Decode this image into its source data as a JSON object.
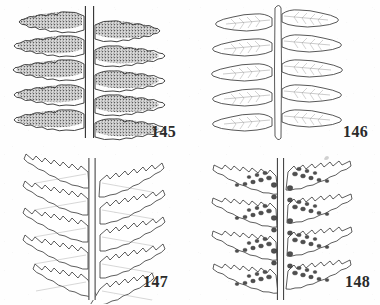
{
  "plate": {
    "background_color": "#fefefe",
    "ink_color": "#2b2b2b",
    "sori_fill_color": "#585858",
    "layout": "2x2 grid of pinnately compound fern frond line drawings, each labelled with a figure number at lower right",
    "medium": "scanned black-and-white botanical line illustration"
  },
  "figures": [
    {
      "number": "145",
      "position": "top-left",
      "pinna_pairs": 5,
      "outline_style": "crenate-scalloped margin",
      "fill": "dense stipple covering almost the entire pinna surface (mature sori)",
      "rachis": "narrow pale vertical band with dark double outline",
      "description": "Frond segment with oblong blunt pinnae almost wholly covered by dense confluent sori"
    },
    {
      "number": "146",
      "position": "top-right",
      "pinna_pairs": 5,
      "outline_style": "finely toothed to entire margin",
      "fill": "open white interior with faint midvein and oblique lateral veins",
      "rachis": "slender pale midrib with fine outline",
      "description": "Sterile frond segment with blunt oblong pinnae, venation visible, no sori"
    },
    {
      "number": "147",
      "position": "bottom-left",
      "pinna_pairs": 5,
      "outline_style": "deeply serrate / incised pinnule lobes",
      "fill": "white interior with faint vein lines",
      "rachis": "pale vertical band with dark double outline",
      "description": "Frond segment with narrow deeply toothed pinnae, sterile, lobes ascending"
    },
    {
      "number": "148",
      "position": "bottom-right",
      "pinna_pairs": 4,
      "outline_style": "serrate, lobed margin",
      "fill": "white interior with rounded dark sori clustered along the midvein and inner lobes",
      "rachis": "pale vertical band flanked by dense dark sori",
      "description": "Fertile frond segment with serrate pinnae bearing discrete rounded sori"
    }
  ],
  "artifacts": {
    "speck_label": "faint scan speck above figure 148"
  }
}
